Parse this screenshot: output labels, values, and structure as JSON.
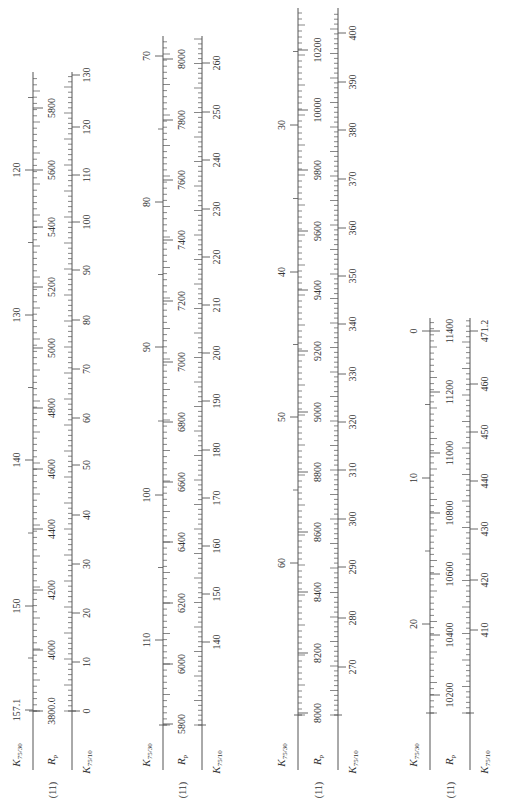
{
  "figure": {
    "equation_tag": "(11)",
    "orientation": "rotated-90-ccw",
    "axis_names": {
      "k30": {
        "main": "K",
        "sub": "75/30"
      },
      "rp": {
        "main": "R",
        "sub": "p"
      },
      "k10": {
        "main": "K",
        "sub": "75/10"
      }
    }
  },
  "chart_data": {
    "type": "nomogram",
    "title": "",
    "panels": [
      {
        "name": "panel-1",
        "x_k30": 33,
        "x_rp": 52,
        "x_k10": 72,
        "y_top": 72,
        "y_base": 711,
        "y_bottom": 770,
        "k30": {
          "labels": [
            120,
            130,
            140,
            150,
            157.1
          ],
          "label_text": [
            "120",
            "130",
            "140",
            "150",
            "157.1"
          ],
          "y": [
            170,
            315,
            460,
            606,
            710
          ]
        },
        "rp": {
          "labels": [
            5800,
            5600,
            5400,
            5200,
            5000,
            4800,
            4600,
            4400,
            4200,
            4000,
            3800
          ],
          "label_text": [
            "5800",
            "5600",
            "5400",
            "5200",
            "5000",
            "4800",
            "4600",
            "4400",
            "4200",
            "4000",
            "3800.0"
          ],
          "y": [
            108,
            170,
            227,
            287,
            348,
            408,
            469,
            529,
            590,
            650,
            711
          ]
        },
        "k10": {
          "labels": [
            130,
            120,
            110,
            100,
            90,
            80,
            70,
            60,
            50,
            40,
            30,
            20,
            10,
            0
          ],
          "label_text": [
            "130",
            "120",
            "110",
            "100",
            "90",
            "80",
            "70",
            "60",
            "50",
            "40",
            "30",
            "20",
            "10",
            "0"
          ],
          "y": [
            75,
            127,
            175,
            222,
            270,
            320,
            369,
            418,
            465,
            515,
            564,
            613,
            662,
            711
          ]
        }
      },
      {
        "name": "panel-2",
        "x_k30": 163,
        "x_rp": 182,
        "x_k10": 202,
        "y_top": 36,
        "y_base": 725,
        "y_bottom": 770,
        "k30": {
          "labels": [
            70,
            80,
            90,
            100,
            110
          ],
          "label_text": [
            "70",
            "80",
            "90",
            "100",
            "110"
          ],
          "y": [
            56,
            202,
            347,
            495,
            640
          ]
        },
        "rp": {
          "labels": [
            8000,
            7800,
            7600,
            7400,
            7200,
            7000,
            6800,
            6600,
            6400,
            6200,
            6000,
            5800
          ],
          "label_text": [
            "8000",
            "7800",
            "7600",
            "7400",
            "7200",
            "7000",
            "6800",
            "6600",
            "6400",
            "6200",
            "6000",
            "5800"
          ],
          "y": [
            59,
            120,
            180,
            240,
            301,
            362,
            422,
            482,
            542,
            603,
            664,
            724
          ]
        },
        "k10": {
          "labels": [
            260,
            250,
            240,
            230,
            220,
            210,
            200,
            190,
            180,
            170,
            160,
            150,
            140
          ],
          "label_text": [
            "260",
            "250",
            "240",
            "230",
            "220",
            "210",
            "200",
            "190",
            "180",
            "170",
            "160",
            "150",
            "140"
          ],
          "y": [
            63,
            112,
            160,
            209,
            257,
            305,
            353,
            401,
            450,
            498,
            546,
            594,
            642
          ]
        }
      },
      {
        "name": "panel-3",
        "x_k30": 298,
        "x_rp": 318,
        "x_k10": 338,
        "y_top": 8,
        "y_base": 715,
        "y_bottom": 770,
        "k30": {
          "labels": [
            30,
            40,
            50,
            60
          ],
          "label_text": [
            "30",
            "40",
            "50",
            "60"
          ],
          "y": [
            125,
            272,
            417,
            563
          ]
        },
        "rp": {
          "labels": [
            10200,
            10000,
            9800,
            9600,
            9400,
            9200,
            9000,
            8800,
            8600,
            8400,
            8200,
            8000
          ],
          "label_text": [
            "10200",
            "10000",
            "9800",
            "9600",
            "9400",
            "9200",
            "9000",
            "8800",
            "8600",
            "8400",
            "8200",
            "8000"
          ],
          "y": [
            50,
            110,
            170,
            231,
            290,
            351,
            412,
            472,
            532,
            592,
            653,
            713
          ]
        },
        "k10": {
          "labels": [
            400,
            390,
            380,
            370,
            360,
            350,
            340,
            330,
            320,
            310,
            300,
            290,
            280,
            270
          ],
          "label_text": [
            "400",
            "390",
            "380",
            "370",
            "360",
            "350",
            "340",
            "330",
            "320",
            "310",
            "300",
            "290",
            "280",
            "270"
          ],
          "y": [
            33,
            82,
            130,
            179,
            228,
            276,
            324,
            374,
            422,
            470,
            519,
            567,
            618,
            667
          ]
        }
      },
      {
        "name": "panel-4",
        "x_k30": 430,
        "x_rp": 450,
        "x_k10": 470,
        "y_top": 318,
        "y_base": 713,
        "y_bottom": 770,
        "k30": {
          "labels": [
            0,
            10,
            20
          ],
          "label_text": [
            "0",
            "10",
            "20"
          ],
          "y": [
            331,
            478,
            624
          ]
        },
        "rp": {
          "labels": [
            11400,
            11200,
            11000,
            10800,
            10600,
            10400,
            10200
          ],
          "label_text": [
            "11400",
            "11200",
            "11000",
            "10800",
            "10600",
            "10400",
            "10200"
          ],
          "y": [
            331,
            392,
            453,
            513,
            574,
            635,
            695
          ]
        },
        "k10": {
          "labels": [
            471.2,
            460,
            450,
            440,
            430,
            420,
            410
          ],
          "label_text": [
            "471.2",
            "460",
            "450",
            "440",
            "430",
            "420",
            "410"
          ],
          "y": [
            331,
            384,
            432,
            481,
            529,
            580,
            630
          ]
        }
      }
    ]
  }
}
